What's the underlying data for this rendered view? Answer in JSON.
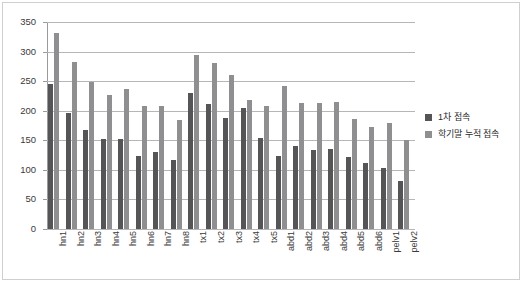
{
  "chart_data": {
    "type": "bar",
    "title": "",
    "subtitle": "",
    "xlabel": "",
    "ylabel": "",
    "ylim": [
      0,
      350
    ],
    "ytick_step": 50,
    "yticks": [
      0,
      50,
      100,
      150,
      200,
      250,
      300,
      350
    ],
    "ytick_labels": [
      "0",
      "50",
      "100",
      "150",
      "200",
      "250",
      "300",
      "350"
    ],
    "grid": true,
    "grid_axis": "y",
    "legend_position": "right",
    "categories": [
      "hn1",
      "hn2",
      "hn3",
      "hn4",
      "hn5",
      "hn6",
      "hn7",
      "hn8",
      "tx1",
      "tx2",
      "tx3",
      "tx4",
      "tx5",
      "abd1",
      "abd2",
      "abd3",
      "abd4",
      "abd5",
      "abd6",
      "pelv1",
      "pelv2"
    ],
    "series": [
      {
        "name": "1차 접속",
        "color": "#555457",
        "values": [
          246,
          197,
          168,
          152,
          152,
          123,
          130,
          117,
          230,
          212,
          188,
          204,
          154,
          123,
          140,
          134,
          136,
          122,
          112,
          103,
          82
        ]
      },
      {
        "name": "학기말 누적 접속",
        "color": "#8f8e91",
        "values": [
          331,
          283,
          249,
          226,
          236,
          208,
          208,
          185,
          294,
          281,
          260,
          218,
          208,
          241,
          213,
          213,
          214,
          186,
          172,
          180,
          150
        ]
      }
    ]
  },
  "legend": {
    "items": [
      {
        "label": "1차 접속",
        "swatch": "legend-swatch-series-1"
      },
      {
        "label": "학기말 누적 접속",
        "swatch": "legend-swatch-series-2"
      }
    ]
  },
  "colors": {
    "series_1": "#555457",
    "series_2": "#8f8e91",
    "gridline": "#b6b6b6",
    "axis": "#9a9a9a",
    "frame": "#cfcfcf",
    "background": "#ffffff",
    "text": "#3a3a3a"
  }
}
